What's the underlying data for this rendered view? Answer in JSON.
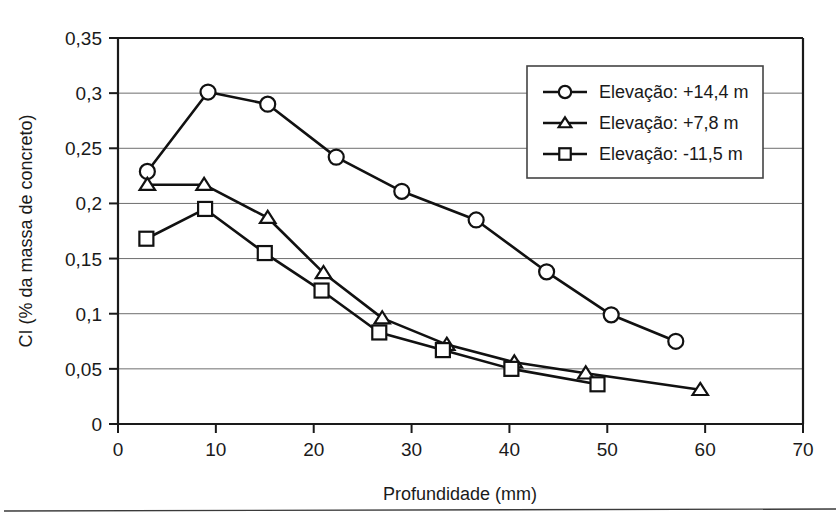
{
  "chart_data": {
    "type": "line",
    "title": "",
    "xlabel": "Profundidade (mm)",
    "ylabel": "CI (% da massa de concreto)",
    "xlim": [
      0,
      70
    ],
    "ylim": [
      0,
      0.35
    ],
    "grid": true,
    "legend_position": "top-right",
    "xticks": [
      "0",
      "10",
      "20",
      "30",
      "40",
      "50",
      "60",
      "70"
    ],
    "xtick_values": [
      0,
      10,
      20,
      30,
      40,
      50,
      60,
      70
    ],
    "yticks": [
      "0",
      "0,05",
      "0,1",
      "0,15",
      "0,2",
      "0,25",
      "0,3",
      "0,35"
    ],
    "ytick_values": [
      0,
      0.05,
      0.1,
      0.15,
      0.2,
      0.25,
      0.3,
      0.35
    ],
    "series": [
      {
        "name": "Elevação: +14,4 m",
        "marker": "circle",
        "x": [
          3.0,
          9.2,
          15.3,
          22.3,
          29.0,
          36.6,
          43.8,
          50.4,
          57.0
        ],
        "y": [
          0.229,
          0.301,
          0.29,
          0.242,
          0.211,
          0.185,
          0.138,
          0.099,
          0.075
        ]
      },
      {
        "name": "Elevação: +7,8 m",
        "marker": "triangle",
        "x": [
          3.0,
          8.8,
          15.3,
          21.0,
          27.0,
          33.6,
          40.5,
          47.8,
          59.5
        ],
        "y": [
          0.217,
          0.217,
          0.187,
          0.137,
          0.096,
          0.072,
          0.056,
          0.046,
          0.031
        ]
      },
      {
        "name": "Elevação: -11,5 m",
        "marker": "square",
        "x": [
          2.9,
          8.9,
          15.0,
          20.8,
          26.7,
          33.2,
          40.2,
          49.0
        ],
        "y": [
          0.168,
          0.195,
          0.155,
          0.121,
          0.083,
          0.067,
          0.05,
          0.036
        ]
      }
    ]
  },
  "legend": {
    "entries": [
      {
        "label": "Elevação: +14,4 m",
        "marker": "circle"
      },
      {
        "label": "Elevação: +7,8 m",
        "marker": "triangle"
      },
      {
        "label": "Elevação: -11,5 m",
        "marker": "square"
      }
    ]
  },
  "colors": {
    "line": "#111111",
    "grid": "#6e6e6e",
    "axis": "#1a1a1a",
    "marker_fill": "#ffffff",
    "background": "#ffffff"
  }
}
